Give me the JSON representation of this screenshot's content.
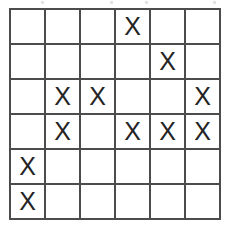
{
  "grid": {
    "rows": 6,
    "columns": 6,
    "mark_symbol": "X",
    "empty_symbol": "",
    "line_color": "#4c4c4c",
    "mark_color": "#242424",
    "background_color": "#ffffff",
    "cells": [
      [
        "",
        "",
        "",
        "X",
        "",
        ""
      ],
      [
        "",
        "",
        "",
        "",
        "X",
        ""
      ],
      [
        "",
        "X",
        "X",
        "",
        "",
        "X"
      ],
      [
        "",
        "X",
        "",
        "X",
        "X",
        "X"
      ],
      [
        "X",
        "",
        "",
        "",
        "",
        ""
      ],
      [
        "X",
        "",
        "",
        "",
        "",
        ""
      ]
    ],
    "marked_count": 11
  }
}
